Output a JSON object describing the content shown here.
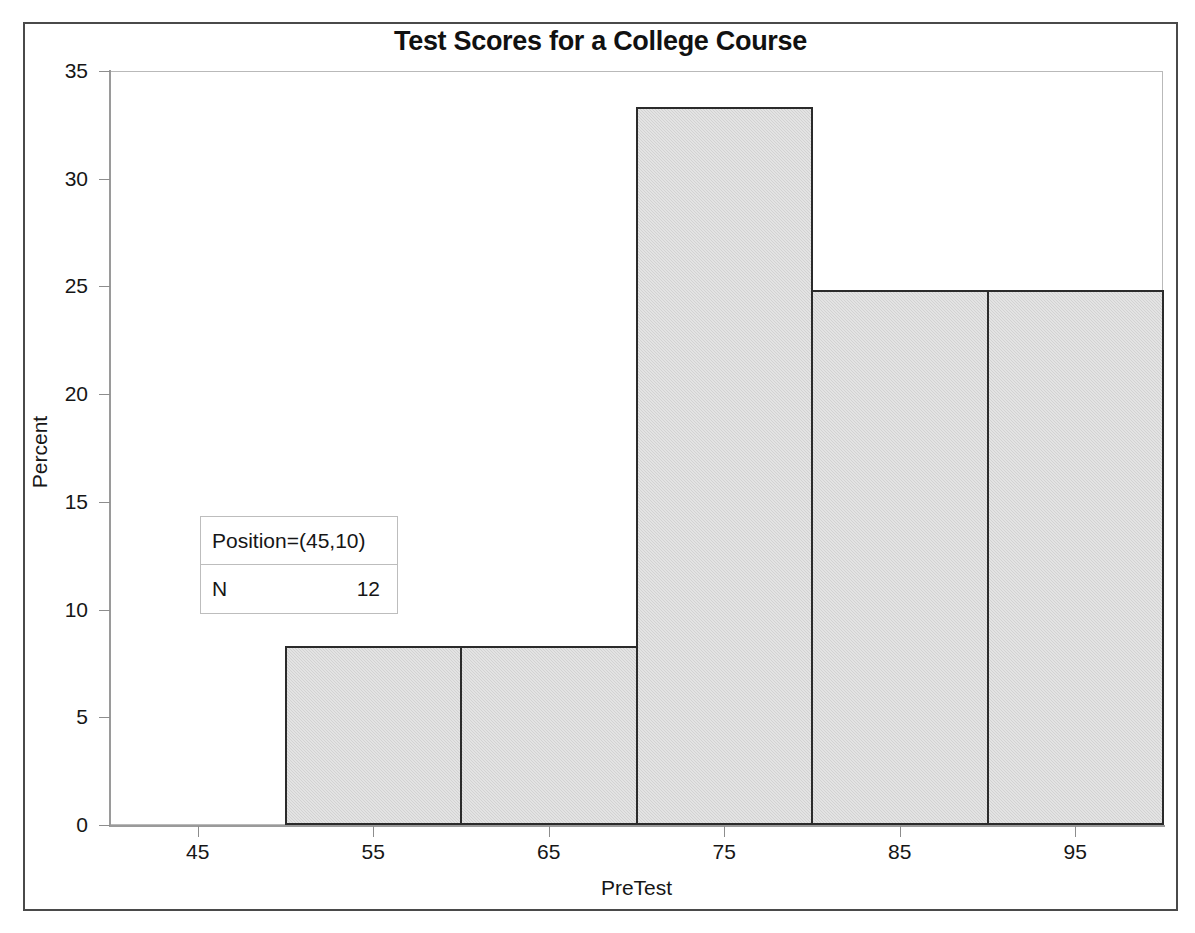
{
  "figure": {
    "title": "Test Scores for a College Course",
    "x_axis_title": "PreTest",
    "y_axis_title": "Percent"
  },
  "inset": {
    "header": "Position=(45,10)",
    "row_label": "N",
    "row_value": "12"
  },
  "colors": {
    "bar_fill": "#d2d2d2",
    "bar_outline": "#2b2b2b",
    "axis": "#9a9a9a",
    "frame": "#4a4a4a",
    "text": "#161616"
  },
  "chart_data": {
    "type": "bar",
    "title": "Test Scores for a College Course",
    "xlabel": "PreTest",
    "ylabel": "Percent",
    "xlim": [
      40,
      100
    ],
    "ylim": [
      0,
      35
    ],
    "grid": false,
    "legend": null,
    "x_ticks": [
      45,
      55,
      65,
      75,
      85,
      95
    ],
    "y_ticks": [
      0,
      5,
      10,
      15,
      20,
      25,
      30,
      35
    ],
    "bin_width": 10,
    "bins": [
      {
        "label": "50-60",
        "x_start": 50,
        "x_end": 60,
        "value": 8.33
      },
      {
        "label": "60-70",
        "x_start": 60,
        "x_end": 70,
        "value": 8.33
      },
      {
        "label": "70-80",
        "x_start": 70,
        "x_end": 80,
        "value": 33.33
      },
      {
        "label": "80-90",
        "x_start": 80,
        "x_end": 90,
        "value": 24.85
      },
      {
        "label": "90-100",
        "x_start": 90,
        "x_end": 100,
        "value": 24.85
      }
    ],
    "categories": [
      "50-60",
      "60-70",
      "70-80",
      "80-90",
      "90-100"
    ],
    "values": [
      8.33,
      8.33,
      33.33,
      24.85,
      24.85
    ],
    "annotations": [
      {
        "text": "Position=(45,10)",
        "type": "inset-header"
      },
      {
        "text": "N  12",
        "type": "inset-row"
      }
    ]
  }
}
